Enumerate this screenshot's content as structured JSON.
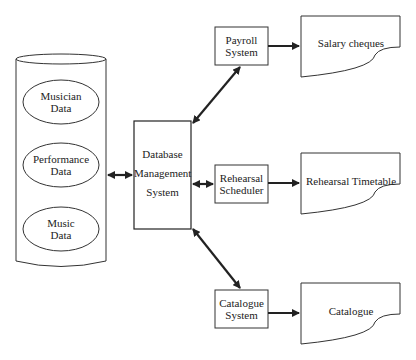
{
  "diagram": {
    "database": {
      "shape": "cylinder",
      "stores": [
        {
          "line1": "Musician",
          "line2": "Data"
        },
        {
          "line1": "Performance",
          "line2": "Data"
        },
        {
          "line1": "Music",
          "line2": "Data"
        }
      ]
    },
    "dbms": {
      "line1": "Database",
      "line2": "Management",
      "line3": "System"
    },
    "processes": [
      {
        "line1": "Payroll",
        "line2": "System",
        "output": "Salary cheques"
      },
      {
        "line1": "Rehearsal",
        "line2": "Scheduler",
        "output": "Rehearsal Timetable"
      },
      {
        "line1": "Catalogue",
        "line2": "System",
        "output": "Catalogue"
      }
    ],
    "connections": [
      {
        "from": "Database",
        "to": "Database Management System",
        "type": "bidirectional"
      },
      {
        "from": "Database Management System",
        "to": "Payroll System",
        "type": "bidirectional"
      },
      {
        "from": "Database Management System",
        "to": "Rehearsal Scheduler",
        "type": "bidirectional"
      },
      {
        "from": "Database Management System",
        "to": "Catalogue System",
        "type": "bidirectional"
      },
      {
        "from": "Payroll System",
        "to": "Salary cheques",
        "type": "directed"
      },
      {
        "from": "Rehearsal Scheduler",
        "to": "Rehearsal Timetable",
        "type": "directed"
      },
      {
        "from": "Catalogue System",
        "to": "Catalogue",
        "type": "directed"
      }
    ],
    "colors": {
      "stroke": "#222222",
      "background": "#ffffff"
    }
  }
}
